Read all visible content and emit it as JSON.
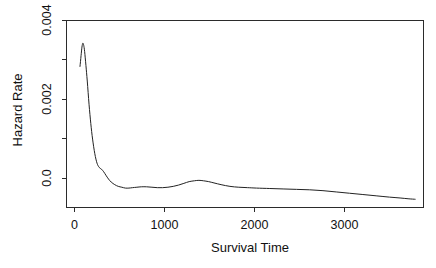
{
  "chart_data": {
    "type": "line",
    "title": "",
    "xlabel": "Survival Time",
    "ylabel": "Hazard Rate",
    "xlim": [
      -150,
      3890
    ],
    "ylim": [
      0.0,
      0.00435
    ],
    "grid": false,
    "legend": "none",
    "x_ticks": [
      0,
      1000,
      2000,
      3000
    ],
    "x_tick_labels": [
      "0",
      "1000",
      "2000",
      "3000"
    ],
    "y_ticks": [
      0.0,
      0.001,
      0.002,
      0.003,
      0.004
    ],
    "y_tick_labels": [
      "0.0",
      "",
      "0.002",
      "",
      "0.004"
    ],
    "y_labeled_ticks": [
      0.0,
      0.002,
      0.004
    ],
    "series": [
      {
        "name": "Smoothed hazard rate",
        "color": "#222222",
        "x": [
          8,
          20,
          30,
          40,
          50,
          60,
          75,
          90,
          110,
          130,
          150,
          175,
          200,
          225,
          250,
          275,
          300,
          330,
          360,
          400,
          440,
          480,
          520,
          560,
          600,
          650,
          700,
          760,
          820,
          880,
          940,
          1000,
          1060,
          1120,
          1180,
          1240,
          1300,
          1350,
          1400,
          1460,
          1520,
          1600,
          1700,
          1800,
          1900,
          2000,
          2150,
          2300,
          2450,
          2600,
          2750,
          2900,
          3050,
          3200,
          3350,
          3500,
          3620,
          3720,
          3790
        ],
        "y": [
          0.00327,
          0.00352,
          0.00372,
          0.00381,
          0.00376,
          0.00362,
          0.00329,
          0.00293,
          0.00239,
          0.00194,
          0.00158,
          0.00124,
          0.00102,
          0.00092,
          0.00088,
          0.00082,
          0.00074,
          0.00065,
          0.00058,
          0.00052,
          0.00048,
          0.00046,
          0.00044,
          0.00044,
          0.00045,
          0.00046,
          0.00047,
          0.00047,
          0.00046,
          0.00045,
          0.00045,
          0.00046,
          0.00048,
          0.00051,
          0.00055,
          0.00059,
          0.00061,
          0.00062,
          0.00061,
          0.00059,
          0.00056,
          0.00052,
          0.00048,
          0.00046,
          0.00045,
          0.00044,
          0.00043,
          0.00042,
          0.00041,
          0.0004,
          0.00038,
          0.00035,
          0.00032,
          0.00029,
          0.00026,
          0.00023,
          0.00021,
          0.00019,
          0.00018
        ]
      }
    ],
    "axes_geometry": {
      "frame_left": 66,
      "frame_right": 424,
      "frame_top": 20,
      "frame_bottom": 207
    }
  }
}
